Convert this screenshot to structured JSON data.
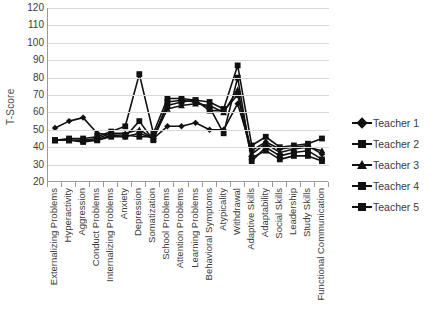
{
  "chart_data": {
    "type": "line",
    "title": "",
    "xlabel": "",
    "ylabel": "T-Score",
    "ylim": [
      20,
      120
    ],
    "ytick_step": 10,
    "yticks": [
      120,
      110,
      100,
      90,
      80,
      70,
      60,
      50,
      40,
      30,
      20
    ],
    "grid": true,
    "legend_position": "right",
    "line_color": "#111111",
    "gridline_color": "#d9d9d9",
    "axis_color": "#9a9a9a",
    "categories": [
      "Externalizing Problems",
      "Hyperactivity",
      "Aggression",
      "Conduct Problems",
      "Internalizing Problems",
      "Anxiety",
      "Depression",
      "Somatization",
      "School Problems",
      "Attention Problems",
      "Learning Problems",
      "Behavioral Symptoms",
      "Atypicality",
      "Withdrawal",
      "Adaptive Skills",
      "Adaptability",
      "Social Skills",
      "Leadership",
      "Study Skills",
      "Functional Communication"
    ],
    "series": [
      {
        "name": "Teacher 1",
        "marker": "diamond",
        "values": [
          51,
          55,
          57,
          48,
          47,
          46,
          48,
          45,
          52,
          52,
          54,
          50,
          50,
          65,
          38,
          43,
          39,
          40,
          41,
          36
        ]
      },
      {
        "name": "Teacher 2",
        "marker": "square",
        "values": [
          44,
          44,
          43,
          44,
          47,
          47,
          46,
          46,
          64,
          66,
          67,
          61,
          61,
          70,
          34,
          38,
          33,
          35,
          35,
          32
        ]
      },
      {
        "name": "Teacher 3",
        "marker": "triangle",
        "values": [
          44,
          44,
          44,
          45,
          48,
          48,
          50,
          45,
          62,
          64,
          65,
          64,
          60,
          73,
          36,
          42,
          37,
          39,
          40,
          38
        ]
      },
      {
        "name": "Teacher 4",
        "marker": "square",
        "values": [
          44,
          45,
          45,
          46,
          49,
          52,
          82,
          48,
          68,
          68,
          67,
          66,
          62,
          87,
          41,
          46,
          40,
          41,
          42,
          45
        ]
      },
      {
        "name": "Teacher 5",
        "marker": "square",
        "values": [
          44,
          44,
          44,
          44,
          46,
          46,
          55,
          44,
          66,
          67,
          66,
          63,
          48,
          80,
          32,
          40,
          35,
          37,
          38,
          33
        ]
      }
    ]
  },
  "legend": {
    "items": [
      {
        "label": "Teacher 1",
        "marker": "diamond"
      },
      {
        "label": "Teacher 2",
        "marker": "square"
      },
      {
        "label": "Teacher 3",
        "marker": "triangle"
      },
      {
        "label": "Teacher 4",
        "marker": "square"
      },
      {
        "label": "Teacher 5",
        "marker": "square"
      }
    ]
  }
}
